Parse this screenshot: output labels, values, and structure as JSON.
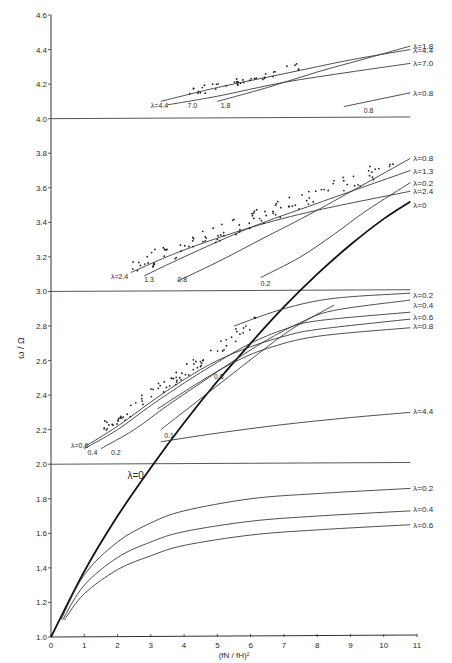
{
  "chart_data": {
    "type": "line",
    "title": "",
    "xlabel": "(fN / fH)²",
    "ylabel": "ω / Ω",
    "xlim": [
      0,
      11
    ],
    "ylim": [
      1.0,
      4.6
    ],
    "grid": false,
    "x_ticks": [
      "0",
      "1",
      "2",
      "3",
      "4",
      "5",
      "6",
      "7",
      "8",
      "9",
      "10",
      "11"
    ],
    "y_ticks": [
      "1.0",
      "1.2",
      "1.4",
      "1.6",
      "1.8",
      "2.0",
      "2.2",
      "2.4",
      "2.6",
      "2.8",
      "3.0",
      "3.2",
      "3.4",
      "3.6",
      "3.8",
      "4.0",
      "4.2",
      "4.4",
      "4.6"
    ],
    "harmonic_lines": [
      2.0,
      3.0,
      4.0
    ],
    "series": [
      {
        "name": "λ=0",
        "band": "main",
        "bold": true,
        "points": [
          [
            0,
            1.0
          ],
          [
            1,
            1.38
          ],
          [
            2,
            1.7
          ],
          [
            3,
            1.98
          ],
          [
            4,
            2.24
          ],
          [
            5,
            2.48
          ],
          [
            6,
            2.7
          ],
          [
            7,
            2.91
          ],
          [
            8,
            3.1
          ],
          [
            9,
            3.27
          ],
          [
            10,
            3.42
          ],
          [
            10.8,
            3.52
          ]
        ]
      },
      {
        "name": "λ=0.2",
        "band": "1",
        "points": [
          [
            0.3,
            1.1
          ],
          [
            1,
            1.36
          ],
          [
            2,
            1.55
          ],
          [
            3,
            1.66
          ],
          [
            4,
            1.73
          ],
          [
            6,
            1.8
          ],
          [
            8,
            1.83
          ],
          [
            10.8,
            1.86
          ]
        ]
      },
      {
        "name": "λ=0.4",
        "band": "1",
        "points": [
          [
            0.35,
            1.1
          ],
          [
            1,
            1.3
          ],
          [
            2,
            1.46
          ],
          [
            3,
            1.55
          ],
          [
            4,
            1.61
          ],
          [
            6,
            1.67
          ],
          [
            8,
            1.7
          ],
          [
            10.8,
            1.73
          ]
        ]
      },
      {
        "name": "λ=0.6",
        "band": "1",
        "points": [
          [
            0.4,
            1.1
          ],
          [
            1,
            1.25
          ],
          [
            2,
            1.39
          ],
          [
            3,
            1.47
          ],
          [
            4,
            1.53
          ],
          [
            6,
            1.59
          ],
          [
            8,
            1.62
          ],
          [
            10.8,
            1.65
          ]
        ]
      },
      {
        "name": "λ=0.6",
        "band": "2",
        "label": "λ=0.6",
        "points": [
          [
            1,
            2.1
          ],
          [
            2,
            2.22
          ],
          [
            3,
            2.36
          ],
          [
            4,
            2.49
          ],
          [
            5,
            2.6
          ],
          [
            6,
            2.68
          ],
          [
            7,
            2.74
          ],
          [
            8,
            2.78
          ],
          [
            10.8,
            2.84
          ]
        ]
      },
      {
        "name": "λ=0.4",
        "band": "2",
        "label": "0.4",
        "points": [
          [
            1,
            2.09
          ],
          [
            2,
            2.2
          ],
          [
            3,
            2.34
          ],
          [
            4,
            2.47
          ],
          [
            5,
            2.59
          ],
          [
            6,
            2.7
          ],
          [
            7,
            2.78
          ],
          [
            8,
            2.83
          ],
          [
            10.8,
            2.88
          ]
        ]
      },
      {
        "name": "λ=0.2",
        "band": "2",
        "label": "0.2",
        "points": [
          [
            1.5,
            2.09
          ],
          [
            2.5,
            2.2
          ],
          [
            3.5,
            2.34
          ],
          [
            4.5,
            2.47
          ],
          [
            5.5,
            2.6
          ],
          [
            6.5,
            2.72
          ],
          [
            7.5,
            2.82
          ],
          [
            8.5,
            2.89
          ],
          [
            10.8,
            2.95
          ]
        ]
      },
      {
        "name": "λ=0.1",
        "band": "2",
        "label": "0.1",
        "points": [
          [
            3.3,
            2.2
          ],
          [
            4.3,
            2.35
          ],
          [
            5.3,
            2.5
          ],
          [
            6.3,
            2.65
          ],
          [
            7.3,
            2.79
          ],
          [
            8.5,
            2.92
          ]
        ]
      },
      {
        "name": "λ=0.8",
        "band": "2",
        "label": "0.8",
        "points": [
          [
            3.2,
            2.32
          ],
          [
            4.5,
            2.48
          ],
          [
            5.5,
            2.59
          ],
          [
            6.5,
            2.67
          ],
          [
            8,
            2.74
          ],
          [
            10.8,
            2.79
          ]
        ]
      },
      {
        "name": "λ=0.2 (top)",
        "band": "2",
        "label": "λ=0.2",
        "points": [
          [
            5.5,
            2.8
          ],
          [
            7,
            2.9
          ],
          [
            8.5,
            2.96
          ],
          [
            10.8,
            2.99
          ]
        ]
      },
      {
        "name": "λ=4.4",
        "band": "2",
        "label": "λ=4.4",
        "points": [
          [
            3.3,
            2.13
          ],
          [
            5,
            2.18
          ],
          [
            7,
            2.23
          ],
          [
            9,
            2.27
          ],
          [
            10.8,
            2.3
          ]
        ]
      },
      {
        "name": "λ=2.4",
        "band": "3",
        "label": "λ=2.4",
        "points": [
          [
            2.4,
            3.11
          ],
          [
            4,
            3.24
          ],
          [
            6,
            3.37
          ],
          [
            8,
            3.47
          ],
          [
            10.8,
            3.58
          ]
        ]
      },
      {
        "name": "λ=1.3",
        "band": "3",
        "label": "1.3",
        "points": [
          [
            2.8,
            3.09
          ],
          [
            4,
            3.2
          ],
          [
            6,
            3.37
          ],
          [
            8,
            3.51
          ],
          [
            10.8,
            3.7
          ]
        ]
      },
      {
        "name": "λ=0.8",
        "band": "3",
        "label": "0.8",
        "points": [
          [
            3.8,
            3.06
          ],
          [
            5,
            3.17
          ],
          [
            6.5,
            3.32
          ],
          [
            8,
            3.47
          ],
          [
            10.8,
            3.77
          ]
        ]
      },
      {
        "name": "λ=0.2",
        "band": "3",
        "label": "0.2",
        "points": [
          [
            6.3,
            3.08
          ],
          [
            7.5,
            3.2
          ],
          [
            8.5,
            3.33
          ],
          [
            9.5,
            3.47
          ],
          [
            10.8,
            3.63
          ]
        ]
      },
      {
        "name": "λ=4.4",
        "band": "4",
        "label": "λ=4.4",
        "points": [
          [
            3.3,
            4.1
          ],
          [
            5,
            4.18
          ],
          [
            7,
            4.26
          ],
          [
            9,
            4.34
          ],
          [
            10.8,
            4.4
          ]
        ]
      },
      {
        "name": "λ=7.0",
        "band": "4",
        "label": "7.0",
        "points": [
          [
            3.5,
            4.08
          ],
          [
            5,
            4.13
          ],
          [
            7,
            4.21
          ],
          [
            9,
            4.27
          ],
          [
            10.8,
            4.32
          ]
        ]
      },
      {
        "name": "λ=1.8",
        "band": "4",
        "label": "1.8",
        "points": [
          [
            5.0,
            4.1
          ],
          [
            6.5,
            4.18
          ],
          [
            8,
            4.27
          ],
          [
            9.5,
            4.35
          ],
          [
            10.8,
            4.42
          ]
        ]
      },
      {
        "name": "λ=0.8",
        "band": "4",
        "label": "0.8",
        "points": [
          [
            8.8,
            4.07
          ],
          [
            9.8,
            4.11
          ],
          [
            10.8,
            4.15
          ]
        ]
      }
    ],
    "right_labels": [
      {
        "text": "λ=1.8",
        "y": 4.42
      },
      {
        "text": "λ=4.4",
        "y": 4.4
      },
      {
        "text": "λ=7.0",
        "y": 4.32
      },
      {
        "text": "λ=0.8",
        "y": 4.15
      },
      {
        "text": "λ=0.8",
        "y": 3.77
      },
      {
        "text": "λ=1.3",
        "y": 3.7
      },
      {
        "text": "λ=0.2",
        "y": 3.63
      },
      {
        "text": "λ=2.4",
        "y": 3.58
      },
      {
        "text": "λ=0",
        "y": 3.5
      },
      {
        "text": "λ=0.2",
        "y": 2.98
      },
      {
        "text": "λ=0.4",
        "y": 2.92
      },
      {
        "text": "λ=0.6",
        "y": 2.85
      },
      {
        "text": "λ=0.8",
        "y": 2.8
      },
      {
        "text": "λ=4.4",
        "y": 2.31
      },
      {
        "text": "λ=0.2",
        "y": 1.86
      },
      {
        "text": "λ=0.4",
        "y": 1.74
      },
      {
        "text": "λ=0.6",
        "y": 1.65
      }
    ],
    "inline_labels": [
      {
        "text": "λ=4.4",
        "x": 3.0,
        "y": 4.08
      },
      {
        "text": "7.0",
        "x": 4.1,
        "y": 4.08
      },
      {
        "text": "1.8",
        "x": 5.1,
        "y": 4.08
      },
      {
        "text": "0.8",
        "x": 9.4,
        "y": 4.05
      },
      {
        "text": "λ=2.4",
        "x": 1.8,
        "y": 3.09
      },
      {
        "text": "1.3",
        "x": 2.8,
        "y": 3.07
      },
      {
        "text": "0.8",
        "x": 3.8,
        "y": 3.07
      },
      {
        "text": "0.2",
        "x": 6.3,
        "y": 3.05
      },
      {
        "text": "0.8",
        "x": 4.9,
        "y": 2.51
      },
      {
        "text": "0.1",
        "x": 3.4,
        "y": 2.17
      },
      {
        "text": "λ=0.6",
        "x": 0.6,
        "y": 2.11
      },
      {
        "text": "0.4",
        "x": 1.1,
        "y": 2.07
      },
      {
        "text": "0.2",
        "x": 1.8,
        "y": 2.07
      },
      {
        "text": "λ=0",
        "x": 2.3,
        "y": 1.93
      }
    ]
  }
}
